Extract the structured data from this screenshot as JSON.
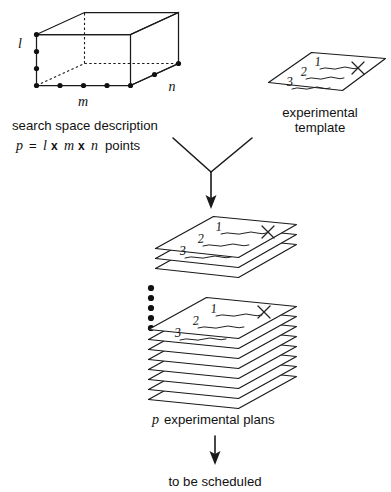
{
  "figure": {
    "background_color": "#ffffff",
    "ink_color": "#111111"
  },
  "search_space": {
    "axis_labels": {
      "height": "l",
      "width": "m",
      "depth": "n"
    },
    "caption_line1": "search space description",
    "caption_line2_parts": {
      "p": "p",
      "equals": "=",
      "l": "l",
      "times1": "x",
      "m": "m",
      "times2": "x",
      "n": "n",
      "points": "points"
    },
    "caption_line2_plain": "p = l x m x n points",
    "grid_points": {
      "height_count": 4,
      "width_count": 5,
      "depth_count": 2
    }
  },
  "template": {
    "caption_line1": "experimental",
    "caption_line2": "template",
    "step_numbers": [
      "1",
      "2",
      "3"
    ],
    "mark": "X"
  },
  "merge": {
    "icon": "merge-arrow-down-icon"
  },
  "plans": {
    "top_stack_sheets": 3,
    "bottom_stack_sheets": 8,
    "ellipsis_dots": 5,
    "step_numbers": [
      "1",
      "2",
      "3"
    ],
    "mark": "X",
    "caption_p": "p",
    "caption_rest": "experimental plans",
    "caption_plain": "p experimental plans"
  },
  "outcome": {
    "arrow_icon": "arrow-down-icon",
    "label": "to be scheduled"
  }
}
